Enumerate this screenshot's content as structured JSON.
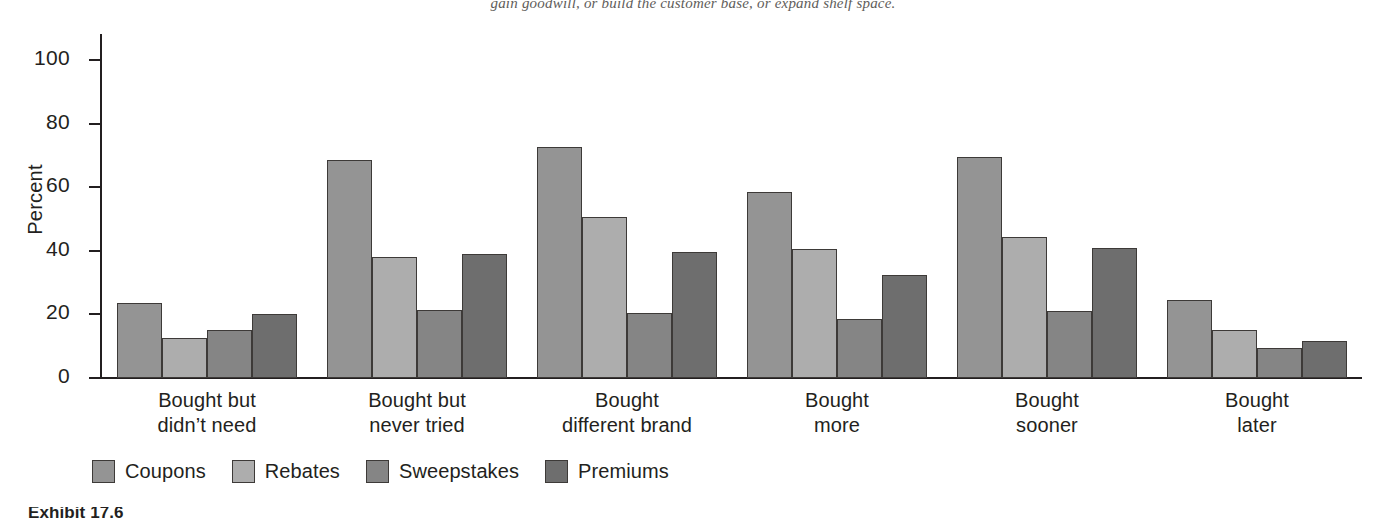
{
  "page": {
    "top_text_fragment": "gain goodwill, or build the customer base, or expand shelf space.",
    "exhibit_caption": "Exhibit 17.6"
  },
  "chart_data": {
    "type": "bar",
    "title": "",
    "xlabel": "",
    "ylabel": "Percent",
    "ylim": [
      0,
      100
    ],
    "ytick_labels": [
      "0",
      "20",
      "40",
      "60",
      "80",
      "100"
    ],
    "yticks": [
      0,
      20,
      40,
      60,
      80,
      100
    ],
    "grid": false,
    "legend_position": "bottom-left",
    "categories": [
      "Bought but\ndidn't need",
      "Bought but\nnever tried",
      "Bought\ndifferent brand",
      "Bought\nmore",
      "Bought\nsooner",
      "Bought\nlater"
    ],
    "category_lines": [
      [
        "Bought but",
        "didn’t need"
      ],
      [
        "Bought but",
        "never tried"
      ],
      [
        "Bought",
        "different brand"
      ],
      [
        "Bought",
        "more"
      ],
      [
        "Bought",
        "sooner"
      ],
      [
        "Bought",
        "later"
      ]
    ],
    "series": [
      {
        "name": "Coupons",
        "color": "#949494",
        "values": [
          23.5,
          68.5,
          72.5,
          58.5,
          69.5,
          24.5
        ]
      },
      {
        "name": "Rebates",
        "color": "#adadad",
        "values": [
          12.5,
          38.0,
          50.5,
          40.5,
          44.5,
          15.0
        ]
      },
      {
        "name": "Sweepstakes",
        "color": "#858585",
        "values": [
          15.0,
          21.5,
          20.5,
          18.5,
          21.0,
          9.5
        ]
      },
      {
        "name": "Premiums",
        "color": "#6e6e6e",
        "values": [
          20.0,
          39.0,
          39.5,
          32.5,
          41.0,
          11.5
        ]
      }
    ]
  }
}
